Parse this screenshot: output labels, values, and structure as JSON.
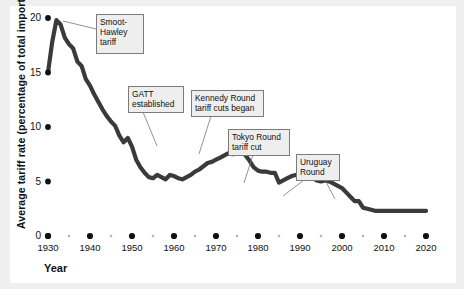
{
  "figure": {
    "background_color": "#efefef",
    "card_color": "#ffffff",
    "line_color": "#3a3a3a",
    "tick_color": "#111111",
    "callout_fill": "#eeeeee",
    "callout_border": "#7b7b7b"
  },
  "axes": {
    "y_label": "Average tariff rate (percentage of total imports)",
    "x_label": "Year",
    "y_ticks": [
      "20",
      "15",
      "10",
      "5",
      "0"
    ],
    "x_ticks": [
      "1930",
      "1940",
      "1950",
      "1960",
      "1970",
      "1980",
      "1990",
      "2000",
      "2010",
      "2020"
    ],
    "minor_x_ticks": [
      "1935",
      "1945",
      "1955",
      "1965",
      "1975",
      "1985",
      "1995",
      "2005",
      "2015"
    ]
  },
  "annotations": [
    {
      "id": "smoot-hawley",
      "text": "Smoot-\nHawley\ntariff",
      "x": 96,
      "y": 14,
      "w": 48,
      "h": 40
    },
    {
      "id": "gatt",
      "text": "GATT\nestablished",
      "x": 128,
      "y": 86,
      "w": 56,
      "h": 26
    },
    {
      "id": "kennedy-round",
      "text": "Kennedy Round\ntariff cuts began",
      "x": 191,
      "y": 90,
      "w": 73,
      "h": 26
    },
    {
      "id": "tokyo-round",
      "text": "Tokyo Round\ntariff cut",
      "x": 228,
      "y": 129,
      "w": 62,
      "h": 26
    },
    {
      "id": "uruguay-round",
      "text": "Uruguay\nRound",
      "x": 296,
      "y": 154,
      "w": 44,
      "h": 26
    }
  ],
  "chart_data": {
    "type": "line",
    "title": "",
    "xlabel": "Year",
    "ylabel": "Average tariff rate (percentage of total imports)",
    "xlim": [
      1930,
      2020
    ],
    "ylim": [
      0,
      20
    ],
    "grid": false,
    "legend": false,
    "series": [
      {
        "name": "Average U.S. tariff rate",
        "x": [
          1930,
          1931,
          1932,
          1933,
          1934,
          1935,
          1936,
          1937,
          1938,
          1939,
          1940,
          1941,
          1942,
          1943,
          1944,
          1945,
          1946,
          1947,
          1948,
          1949,
          1950,
          1951,
          1952,
          1953,
          1954,
          1955,
          1956,
          1957,
          1958,
          1959,
          1960,
          1961,
          1962,
          1963,
          1964,
          1965,
          1966,
          1967,
          1968,
          1969,
          1970,
          1971,
          1972,
          1973,
          1974,
          1975,
          1976,
          1977,
          1978,
          1979,
          1980,
          1981,
          1982,
          1983,
          1984,
          1985,
          1986,
          1987,
          1988,
          1989,
          1990,
          1991,
          1992,
          1993,
          1994,
          1995,
          1996,
          1997,
          1998,
          1999,
          2000,
          2001,
          2002,
          2003,
          2004,
          2005,
          2006,
          2007,
          2008,
          2009,
          2010,
          2011,
          2012,
          2013,
          2014,
          2015,
          2016,
          2017,
          2018,
          2019,
          2020
        ],
        "y": [
          15.0,
          17.8,
          19.8,
          19.4,
          18.2,
          17.6,
          17.2,
          16.0,
          15.6,
          14.4,
          13.8,
          13.0,
          12.3,
          11.6,
          11.0,
          10.5,
          10.1,
          9.2,
          8.6,
          9.0,
          8.2,
          7.0,
          6.3,
          5.8,
          5.4,
          5.3,
          5.6,
          5.4,
          5.2,
          5.6,
          5.5,
          5.3,
          5.2,
          5.4,
          5.6,
          5.9,
          6.1,
          6.4,
          6.7,
          6.8,
          7.0,
          7.2,
          7.4,
          7.6,
          7.5,
          7.6,
          7.8,
          7.4,
          6.9,
          6.3,
          6.0,
          5.9,
          5.9,
          5.8,
          5.8,
          4.9,
          5.1,
          5.3,
          5.5,
          5.6,
          5.5,
          5.4,
          5.3,
          5.3,
          5.1,
          5.0,
          5.1,
          5.0,
          4.8,
          4.6,
          4.4,
          4.0,
          3.6,
          3.2,
          3.2,
          2.6,
          2.5,
          2.4,
          2.3,
          2.3,
          2.3,
          2.3,
          2.3,
          2.3,
          2.3,
          2.3,
          2.3,
          2.3,
          2.3,
          2.3,
          2.3
        ]
      }
    ]
  }
}
